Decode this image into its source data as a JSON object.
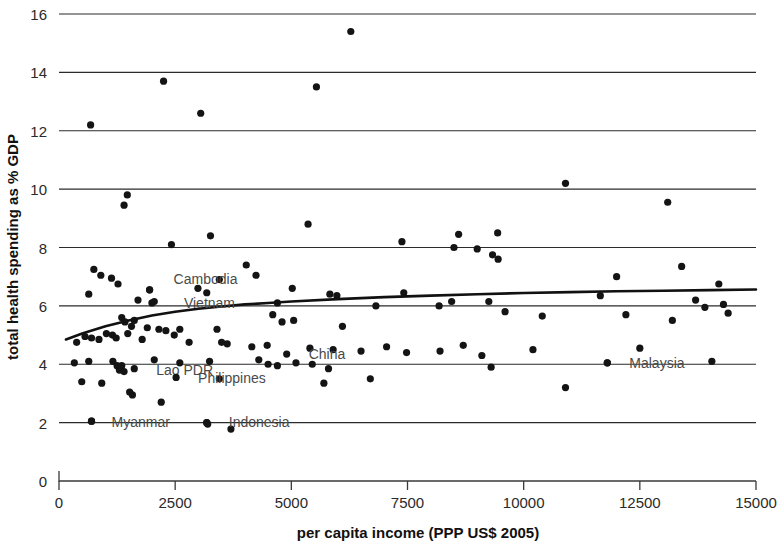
{
  "chart_data": {
    "type": "scatter",
    "title": "",
    "xlabel": "per capita income (PPP US$ 2005)",
    "ylabel": "total health spending as % GDP",
    "xlim": [
      0,
      15000
    ],
    "ylim": [
      0,
      16
    ],
    "xticks": [
      0,
      2500,
      5000,
      7500,
      10000,
      12500,
      15000
    ],
    "xtick_labels": [
      "0",
      "2500",
      "5000",
      "7500",
      "10000",
      "12500",
      "15000"
    ],
    "yticks": [
      0,
      2,
      4,
      6,
      8,
      10,
      12,
      14,
      16
    ],
    "ytick_labels": [
      "0",
      "2",
      "4",
      "6",
      "8",
      "10",
      "12",
      "14",
      "16"
    ],
    "grid": "horizontal",
    "legend": "none",
    "marker_color": "#141414",
    "trendline_color": "#111111",
    "gridline_color": "#2b2b2b",
    "points": [
      [
        6280,
        15.4
      ],
      [
        2250,
        13.7
      ],
      [
        5540,
        13.5
      ],
      [
        3050,
        12.6
      ],
      [
        680,
        12.2
      ],
      [
        1470,
        9.8
      ],
      [
        1400,
        9.45
      ],
      [
        10900,
        10.2
      ],
      [
        13100,
        9.55
      ],
      [
        5360,
        8.8
      ],
      [
        2420,
        8.1
      ],
      [
        3260,
        8.4
      ],
      [
        7380,
        8.2
      ],
      [
        8600,
        8.45
      ],
      [
        8500,
        8.0
      ],
      [
        9440,
        8.5
      ],
      [
        9000,
        7.95
      ],
      [
        9330,
        7.75
      ],
      [
        9450,
        7.6
      ],
      [
        4030,
        7.4
      ],
      [
        4240,
        7.05
      ],
      [
        750,
        7.25
      ],
      [
        900,
        7.05
      ],
      [
        1130,
        6.95
      ],
      [
        1270,
        6.75
      ],
      [
        12000,
        7.0
      ],
      [
        13400,
        7.35
      ],
      [
        14200,
        6.75
      ],
      [
        640,
        6.4
      ],
      [
        1950,
        6.55
      ],
      [
        2990,
        6.6
      ],
      [
        3450,
        6.9
      ],
      [
        3180,
        6.45
      ],
      [
        5020,
        6.6
      ],
      [
        5830,
        6.4
      ],
      [
        5980,
        6.35
      ],
      [
        7420,
        6.45
      ],
      [
        8180,
        6.0
      ],
      [
        1700,
        6.2
      ],
      [
        2050,
        6.15
      ],
      [
        11650,
        6.35
      ],
      [
        13700,
        6.2
      ],
      [
        13900,
        5.95
      ],
      [
        14300,
        6.05
      ],
      [
        1350,
        5.6
      ],
      [
        1420,
        5.45
      ],
      [
        1560,
        5.3
      ],
      [
        1620,
        5.5
      ],
      [
        1900,
        5.25
      ],
      [
        2150,
        5.2
      ],
      [
        2600,
        5.2
      ],
      [
        4700,
        6.1
      ],
      [
        4600,
        5.7
      ],
      [
        5050,
        5.5
      ],
      [
        4800,
        5.45
      ],
      [
        6820,
        6.0
      ],
      [
        6100,
        5.3
      ],
      [
        8450,
        6.15
      ],
      [
        9250,
        6.15
      ],
      [
        9600,
        5.8
      ],
      [
        10400,
        5.65
      ],
      [
        12200,
        5.7
      ],
      [
        13200,
        5.5
      ],
      [
        14400,
        5.75
      ],
      [
        380,
        4.75
      ],
      [
        560,
        4.95
      ],
      [
        700,
        4.9
      ],
      [
        860,
        4.85
      ],
      [
        1020,
        5.05
      ],
      [
        1150,
        5.0
      ],
      [
        1230,
        4.9
      ],
      [
        1480,
        5.05
      ],
      [
        1790,
        4.85
      ],
      [
        2300,
        5.15
      ],
      [
        2480,
        5.0
      ],
      [
        3400,
        5.2
      ],
      [
        2800,
        4.75
      ],
      [
        3500,
        4.75
      ],
      [
        3620,
        4.7
      ],
      [
        4150,
        4.6
      ],
      [
        4480,
        4.65
      ],
      [
        5400,
        4.55
      ],
      [
        5900,
        4.5
      ],
      [
        7050,
        4.6
      ],
      [
        6500,
        4.45
      ],
      [
        7480,
        4.4
      ],
      [
        8700,
        4.65
      ],
      [
        8200,
        4.45
      ],
      [
        9100,
        4.3
      ],
      [
        10200,
        4.5
      ],
      [
        12500,
        4.55
      ],
      [
        330,
        4.05
      ],
      [
        640,
        4.1
      ],
      [
        1160,
        4.1
      ],
      [
        1250,
        3.95
      ],
      [
        1350,
        3.95
      ],
      [
        1300,
        3.8
      ],
      [
        1400,
        3.75
      ],
      [
        2050,
        4.15
      ],
      [
        2600,
        4.05
      ],
      [
        3240,
        4.1
      ],
      [
        4300,
        4.15
      ],
      [
        4500,
        4.0
      ],
      [
        4700,
        3.95
      ],
      [
        5100,
        4.05
      ],
      [
        5450,
        4.0
      ],
      [
        5800,
        3.85
      ],
      [
        9300,
        3.9
      ],
      [
        11800,
        4.05
      ],
      [
        14050,
        4.1
      ],
      [
        490,
        3.4
      ],
      [
        920,
        3.35
      ],
      [
        1520,
        3.05
      ],
      [
        1580,
        2.95
      ],
      [
        2200,
        2.7
      ],
      [
        3450,
        3.5
      ],
      [
        6700,
        3.5
      ],
      [
        5700,
        3.35
      ],
      [
        10900,
        3.2
      ],
      [
        700,
        2.05
      ],
      [
        3180,
        2.0
      ],
      [
        3200,
        1.95
      ],
      [
        3700,
        1.78
      ]
    ],
    "trendline": [
      [
        150,
        4.85
      ],
      [
        500,
        5.05
      ],
      [
        1000,
        5.3
      ],
      [
        1500,
        5.5
      ],
      [
        2000,
        5.67
      ],
      [
        2500,
        5.8
      ],
      [
        3000,
        5.9
      ],
      [
        3500,
        5.98
      ],
      [
        4000,
        6.05
      ],
      [
        4500,
        6.1
      ],
      [
        5000,
        6.15
      ],
      [
        6000,
        6.23
      ],
      [
        7000,
        6.3
      ],
      [
        8000,
        6.35
      ],
      [
        9000,
        6.4
      ],
      [
        10000,
        6.44
      ],
      [
        11000,
        6.47
      ],
      [
        12000,
        6.5
      ],
      [
        13000,
        6.52
      ],
      [
        14000,
        6.54
      ],
      [
        15000,
        6.56
      ]
    ],
    "annotations": [
      {
        "label": "Cambodia",
        "x": 1950,
        "y": 6.55,
        "label_dx": 24,
        "label_dy": -6
      },
      {
        "label": "Vietnam",
        "x": 2000,
        "y": 6.1,
        "label_dx": 32,
        "label_dy": 5
      },
      {
        "label": "China",
        "x": 4900,
        "y": 4.35,
        "label_dx": 22,
        "label_dy": 5
      },
      {
        "label": "Lao PDR",
        "x": 1620,
        "y": 3.85,
        "label_dx": 22,
        "label_dy": 6
      },
      {
        "label": "Philippines",
        "x": 2520,
        "y": 3.55,
        "label_dx": 22,
        "label_dy": 6
      },
      {
        "label": "Myanmar",
        "x": 700,
        "y": 2.05,
        "label_dx": 20,
        "label_dy": 6
      },
      {
        "label": "Indonesia",
        "x": 3180,
        "y": 2.0,
        "label_dx": 22,
        "label_dy": 4
      },
      {
        "label": "Malaysia",
        "x": 11800,
        "y": 4.05,
        "label_dx": 22,
        "label_dy": 5
      }
    ]
  },
  "figure": {
    "background_color": "#ffffff"
  }
}
